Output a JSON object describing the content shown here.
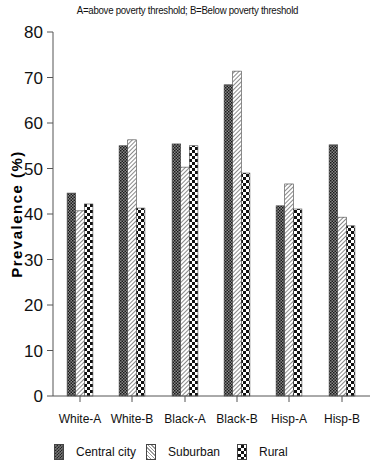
{
  "subtitle": "A=above poverty threshold; B=Below poverty threshold",
  "chart_data": {
    "type": "bar",
    "title": "",
    "subtitle": "A=above poverty threshold; B=Below poverty threshold",
    "xlabel": "",
    "ylabel": "Prevalence (%)",
    "ylim": [
      0,
      80
    ],
    "yticks": [
      0,
      10,
      20,
      30,
      40,
      50,
      60,
      70,
      80
    ],
    "grid": false,
    "legend_position": "bottom",
    "categories": [
      "White-A",
      "White-B",
      "Black-A",
      "Black-B",
      "Hisp-A",
      "Hisp-B"
    ],
    "series": [
      {
        "name": "Central city",
        "pattern": "fine-checker",
        "values": [
          44.6,
          55.0,
          55.4,
          68.4,
          41.8,
          55.2
        ]
      },
      {
        "name": "Suburban",
        "pattern": "diagonal-hatch",
        "values": [
          40.7,
          56.3,
          50.3,
          71.4,
          46.6,
          39.3
        ]
      },
      {
        "name": "Rural",
        "pattern": "coarse-checker",
        "values": [
          42.2,
          41.3,
          55.0,
          49.0,
          41.1,
          37.4
        ]
      }
    ]
  },
  "legend": {
    "items": [
      {
        "label": "Central city"
      },
      {
        "label": "Suburban"
      },
      {
        "label": "Rural"
      }
    ]
  }
}
